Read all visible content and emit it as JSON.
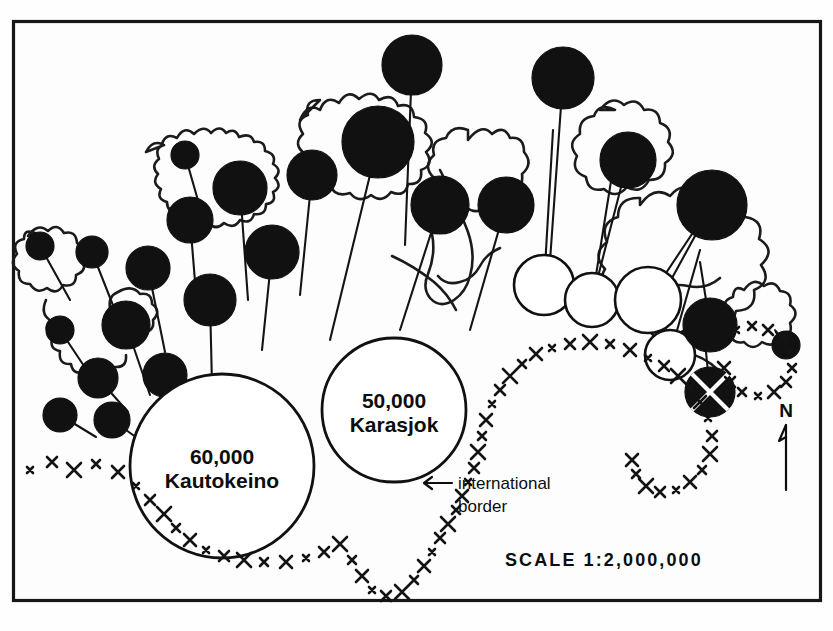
{
  "figure": {
    "kind": "proportional-circle-map",
    "region": "Finnmark reindeer herding districts",
    "background_color": "#fefefe",
    "ink_color": "#111111",
    "frame": {
      "x": 12,
      "y": 20,
      "width": 810,
      "height": 582
    }
  },
  "scale_bar": {
    "label": "SCALE",
    "ratio": "1:2,000,000",
    "full_text": "SCALE  1:2,000,000"
  },
  "north_arrow": {
    "letter": "N",
    "orientation": "up"
  },
  "annotations": [
    {
      "id": "international-border",
      "line1": "international",
      "line2": "border",
      "arrow": "left",
      "x": 458,
      "y": 487
    }
  ],
  "legend_symbols": [
    {
      "id": "filled-circle",
      "meaning": "district with herd, filled symbol",
      "fill": "#111111"
    },
    {
      "id": "open-circle",
      "meaning": "district with herd, open symbol",
      "fill": "#ffffff"
    },
    {
      "id": "crossed-circle",
      "meaning": "district marked with cross overlay",
      "fill": "#111111"
    }
  ],
  "chart_data": {
    "type": "scatter",
    "xlabel": "",
    "ylabel": "",
    "major_circles": [
      {
        "name": "Kautokeino",
        "value": "60,000",
        "value_num": 60000,
        "cx": 222,
        "cy": 466,
        "r": 92,
        "style": "open"
      },
      {
        "name": "Karasjok",
        "value": "50,000",
        "value_num": 50000,
        "cx": 394,
        "cy": 410,
        "r": 72,
        "style": "open"
      }
    ],
    "symbols": [
      {
        "style": "filled",
        "cx": 412,
        "cy": 65,
        "r": 30,
        "lx": 405,
        "ly": 245
      },
      {
        "style": "filled",
        "cx": 563,
        "cy": 78,
        "r": 31,
        "lx": 549,
        "ly": 275
      },
      {
        "style": "filled",
        "cx": 378,
        "cy": 142,
        "r": 36,
        "lx": 330,
        "ly": 340
      },
      {
        "style": "filled",
        "cx": 628,
        "cy": 160,
        "r": 28,
        "lx": 592,
        "ly": 300
      },
      {
        "style": "filled",
        "cx": 185,
        "cy": 155,
        "r": 14,
        "lx": 205,
        "ly": 225
      },
      {
        "style": "filled",
        "cx": 240,
        "cy": 188,
        "r": 27,
        "lx": 248,
        "ly": 300
      },
      {
        "style": "filled",
        "cx": 312,
        "cy": 175,
        "r": 25,
        "lx": 300,
        "ly": 295
      },
      {
        "style": "filled",
        "cx": 440,
        "cy": 205,
        "r": 29,
        "lx": 400,
        "ly": 330
      },
      {
        "style": "filled",
        "cx": 506,
        "cy": 205,
        "r": 28,
        "lx": 470,
        "ly": 330
      },
      {
        "style": "filled",
        "cx": 712,
        "cy": 205,
        "r": 35,
        "lx": 660,
        "ly": 300
      },
      {
        "style": "filled",
        "cx": 190,
        "cy": 220,
        "r": 23,
        "lx": 198,
        "ly": 318
      },
      {
        "style": "filled",
        "cx": 272,
        "cy": 252,
        "r": 27,
        "lx": 262,
        "ly": 350
      },
      {
        "style": "filled",
        "cx": 92,
        "cy": 252,
        "r": 16,
        "lx": 118,
        "ly": 318
      },
      {
        "style": "filled",
        "cx": 148,
        "cy": 268,
        "r": 22,
        "lx": 165,
        "ly": 352
      },
      {
        "style": "filled",
        "cx": 40,
        "cy": 246,
        "r": 14,
        "lx": 70,
        "ly": 300
      },
      {
        "style": "filled",
        "cx": 210,
        "cy": 300,
        "r": 26,
        "lx": 212,
        "ly": 385
      },
      {
        "style": "filled",
        "cx": 126,
        "cy": 325,
        "r": 24,
        "lx": 150,
        "ly": 395
      },
      {
        "style": "filled",
        "cx": 60,
        "cy": 330,
        "r": 14,
        "lx": 88,
        "ly": 372
      },
      {
        "style": "filled",
        "cx": 165,
        "cy": 375,
        "r": 22,
        "lx": 178,
        "ly": 420
      },
      {
        "style": "filled",
        "cx": 98,
        "cy": 378,
        "r": 20,
        "lx": 128,
        "ly": 412
      },
      {
        "style": "filled",
        "cx": 60,
        "cy": 415,
        "r": 17,
        "lx": 96,
        "ly": 437
      },
      {
        "style": "filled",
        "cx": 112,
        "cy": 420,
        "r": 18,
        "lx": 140,
        "ly": 440
      },
      {
        "style": "open",
        "cx": 544,
        "cy": 285,
        "r": 30,
        "lx": 553,
        "ly": 130
      },
      {
        "style": "open",
        "cx": 592,
        "cy": 300,
        "r": 27,
        "lx": 612,
        "ly": 175
      },
      {
        "style": "open",
        "cx": 648,
        "cy": 300,
        "r": 33,
        "lx": 700,
        "ly": 222
      },
      {
        "style": "open",
        "cx": 670,
        "cy": 355,
        "r": 25,
        "lx": 700,
        "ly": 250
      },
      {
        "style": "filled",
        "cx": 710,
        "cy": 325,
        "r": 27,
        "lx": 700,
        "ly": 262
      },
      {
        "style": "filled",
        "cx": 786,
        "cy": 345,
        "r": 14,
        "lx": 775,
        "ly": 330
      },
      {
        "style": "crossed",
        "cx": 710,
        "cy": 392,
        "r": 25,
        "lx": 706,
        "ly": 352
      }
    ]
  }
}
